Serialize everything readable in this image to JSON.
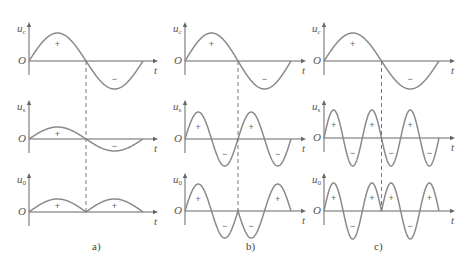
{
  "figure": {
    "captions": [
      "a)",
      "b)",
      "c)"
    ],
    "axis_symbols": {
      "origin": "O",
      "time": "t"
    },
    "row_labels": [
      {
        "var": "u",
        "sub": "c"
      },
      {
        "var": "u",
        "sub": "s"
      },
      {
        "var": "u",
        "sub": "0"
      }
    ],
    "signs": {
      "pos": "+",
      "neg": "−"
    },
    "colors": {
      "curve": "#8a8a8a",
      "axis": "#666666",
      "text": "#555555",
      "dash": "#777777"
    }
  },
  "panels": [
    {
      "id": "a",
      "carrier_cycles": 0.5,
      "description": "u_s in phase with u_c (same frequency); u_0 is full-wave rectified, all positive"
    },
    {
      "id": "b",
      "carrier_cycles": 2,
      "description": "u_s at 2× frequency; u_0 = u_s·sign(u_c): two positive lobes, two negative lobes"
    },
    {
      "id": "c",
      "carrier_cycles": 3,
      "description": "u_s at 3× frequency; u_0 = u_s·sign(u_c)"
    }
  ]
}
